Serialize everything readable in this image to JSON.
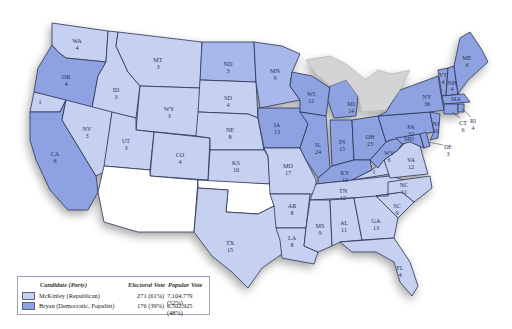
{
  "map": {
    "colors": {
      "mckinley_light": "#c6d1f1",
      "mckinley_mid": "#a9b8ea",
      "bryan_dark": "#8ea2e2",
      "territory": "#ffffff",
      "lakes": "#d3d4d6",
      "border": "#2a3352"
    },
    "states": [
      {
        "abbr": "WA",
        "votes": "4"
      },
      {
        "abbr": "OR",
        "votes": "4"
      },
      {
        "abbr": "CA",
        "votes": "8"
      },
      {
        "abbr": "ID",
        "votes": "3"
      },
      {
        "abbr": "NV",
        "votes": "3"
      },
      {
        "abbr": "MT",
        "votes": "3"
      },
      {
        "abbr": "WY",
        "votes": "3"
      },
      {
        "abbr": "UT",
        "votes": "3"
      },
      {
        "abbr": "CO",
        "votes": "4"
      },
      {
        "abbr": "ND",
        "votes": "3"
      },
      {
        "abbr": "SD",
        "votes": "4"
      },
      {
        "abbr": "NE",
        "votes": "8"
      },
      {
        "abbr": "KS",
        "votes": "10"
      },
      {
        "abbr": "TX",
        "votes": "15"
      },
      {
        "abbr": "MN",
        "votes": "9"
      },
      {
        "abbr": "IA",
        "votes": "13"
      },
      {
        "abbr": "MO",
        "votes": "17"
      },
      {
        "abbr": "AR",
        "votes": "8"
      },
      {
        "abbr": "LA",
        "votes": "8"
      },
      {
        "abbr": "WI",
        "votes": "12"
      },
      {
        "abbr": "IL",
        "votes": "24"
      },
      {
        "abbr": "MI",
        "votes": "14"
      },
      {
        "abbr": "IN",
        "votes": "15"
      },
      {
        "abbr": "OH",
        "votes": "23"
      },
      {
        "abbr": "KY",
        "votes": "12"
      },
      {
        "abbr": "TN",
        "votes": "12"
      },
      {
        "abbr": "MS",
        "votes": "9"
      },
      {
        "abbr": "AL",
        "votes": "11"
      },
      {
        "abbr": "GA",
        "votes": "13"
      },
      {
        "abbr": "FL",
        "votes": "4"
      },
      {
        "abbr": "SC",
        "votes": "9"
      },
      {
        "abbr": "NC",
        "votes": "11"
      },
      {
        "abbr": "VA",
        "votes": "12"
      },
      {
        "abbr": "WV",
        "votes": "6"
      },
      {
        "abbr": "PA",
        "votes": "32"
      },
      {
        "abbr": "NY",
        "votes": "36"
      },
      {
        "abbr": "VT",
        "votes": "4"
      },
      {
        "abbr": "NH",
        "votes": "4"
      },
      {
        "abbr": "ME",
        "votes": "6"
      },
      {
        "abbr": "MA",
        "votes": "15"
      },
      {
        "abbr": "RI",
        "votes": "4"
      },
      {
        "abbr": "CT",
        "votes": "6"
      },
      {
        "abbr": "NJ",
        "votes": "10"
      },
      {
        "abbr": "DE",
        "votes": "3"
      },
      {
        "abbr": "MD",
        "votes": "8"
      }
    ],
    "split_labels": {
      "ca_split": "1",
      "ky_split": "1"
    }
  },
  "legend": {
    "headers": {
      "candidate": "Candidate (Party)",
      "electoral": "Electoral Vote",
      "popular": "Popular Vote"
    },
    "rows": [
      {
        "candidate": "McKinley (Republican)",
        "electoral": "271 (61%)",
        "popular": "7,104,779 (52%)"
      },
      {
        "candidate": "Bryan (Democratic, Populist)",
        "electoral": "176 (39%)",
        "popular": "6,502,925 (48%)"
      }
    ]
  }
}
